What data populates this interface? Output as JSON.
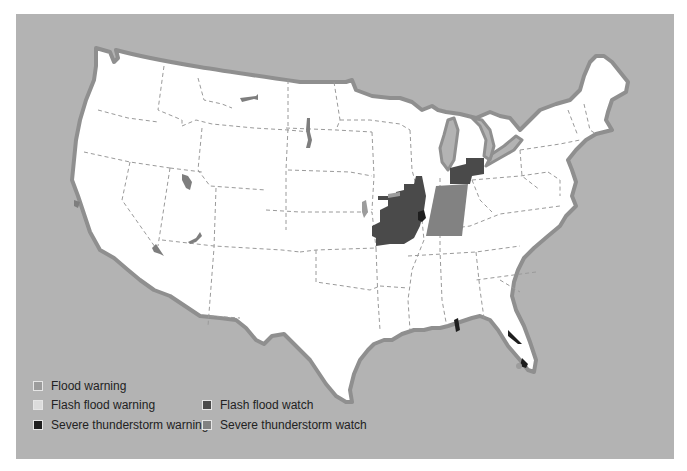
{
  "map": {
    "title": "",
    "region": "Contiguous United States",
    "background_color": "#b3b3b3",
    "land_color": "#ffffff"
  },
  "legend": {
    "items": [
      {
        "label": "Flood warning",
        "color": "#9c9c9c"
      },
      {
        "label": "Flash flood warning",
        "color": "#dcdcdc"
      },
      {
        "label": "Severe thunderstorm warning",
        "color": "#1e1e1e"
      },
      {
        "label": "Flash flood watch",
        "color": "#4a4a4a"
      },
      {
        "label": "Severe thunderstorm watch",
        "color": "#828282"
      }
    ]
  },
  "alerts": [
    {
      "type": "Flash flood watch",
      "area": "Missouri / Illinois"
    },
    {
      "type": "Severe thunderstorm watch",
      "area": "Indiana"
    },
    {
      "type": "Flash flood watch",
      "area": "Northern Ohio"
    },
    {
      "type": "Severe thunderstorm warning",
      "area": "Illinois (St. Louis area)"
    },
    {
      "type": "Flood warning",
      "area": "Iowa / Missouri border"
    },
    {
      "type": "Severe thunderstorm warning",
      "area": "Alabama coast"
    },
    {
      "type": "Severe thunderstorm warning",
      "area": "Florida east coast"
    },
    {
      "type": "Flood warning",
      "area": "Montana"
    },
    {
      "type": "Flood warning",
      "area": "North Dakota / South Dakota"
    },
    {
      "type": "Flood warning",
      "area": "Utah"
    },
    {
      "type": "Flood warning",
      "area": "Nevada / Arizona"
    },
    {
      "type": "Flood warning",
      "area": "California"
    }
  ]
}
